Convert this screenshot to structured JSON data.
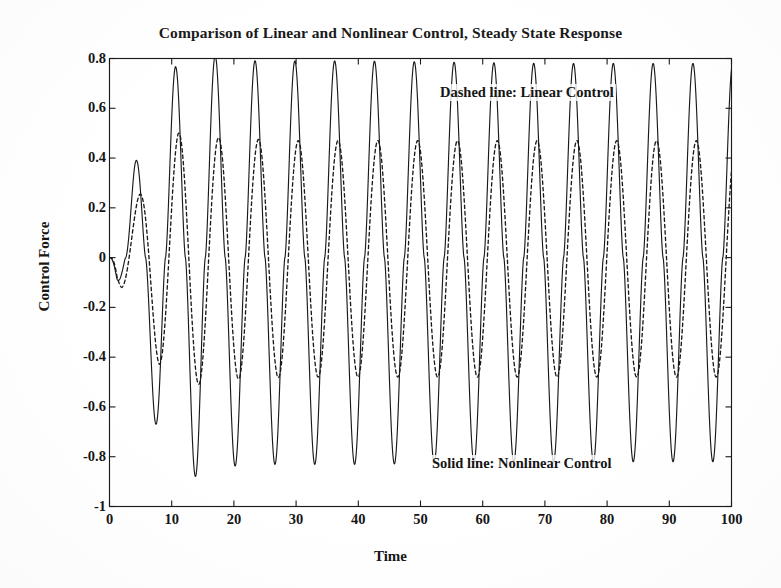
{
  "chart_data": {
    "type": "line",
    "title": "Comparison of Linear and Nonlinear Control, Steady State Response",
    "xlabel": "Time",
    "ylabel": "Control Force",
    "xlim": [
      0,
      100
    ],
    "ylim": [
      -1,
      0.8
    ],
    "xticks": [
      0,
      10,
      20,
      30,
      40,
      50,
      60,
      70,
      80,
      90,
      100
    ],
    "xtick_labels": [
      "0",
      "10",
      "20",
      "30",
      "40",
      "50",
      "60",
      "70",
      "80",
      "90",
      "100"
    ],
    "yticks": [
      -1,
      -0.8,
      -0.6,
      -0.4,
      -0.2,
      0,
      0.2,
      0.4,
      0.6,
      0.8
    ],
    "ytick_labels": [
      "-1",
      "-0.8",
      "-0.6",
      "-0.4",
      "-0.2",
      "0",
      "0.2",
      "0.4",
      "0.6",
      "0.8"
    ],
    "grid": false,
    "legend_position": "inside-annotations",
    "annotations": [
      {
        "id": "dashed",
        "text": "Dashed line: Linear Control",
        "x": 53,
        "y": 0.63
      },
      {
        "id": "solid",
        "text": "Solid line: Nonlinear Control",
        "x": 52,
        "y": -0.78
      }
    ],
    "line_color": "#1a1a1a",
    "background_color": "#ffffff",
    "period": 6.4,
    "series": [
      {
        "name": "Nonlinear Control",
        "style": "solid",
        "color": "#1a1a1a",
        "steady_state_peak": 0.78,
        "steady_state_trough": -0.82,
        "phase_offset": 0.0,
        "waveform": "peaked-sine",
        "peak_sharpness": 1.55,
        "envelope": [
          {
            "t": 0,
            "amp": 0.0
          },
          {
            "t": 2,
            "amp": 0.14
          },
          {
            "t": 4,
            "amp": 0.37
          },
          {
            "t": 8,
            "amp": 0.68
          },
          {
            "t": 11,
            "amp": 0.78
          },
          {
            "t": 14,
            "amp": 0.84
          },
          {
            "t": 18,
            "amp": 0.8
          },
          {
            "t": 24,
            "amp": 0.79
          },
          {
            "t": 40,
            "amp": 0.79
          },
          {
            "t": 70,
            "amp": 0.78
          },
          {
            "t": 100,
            "amp": 0.78
          }
        ],
        "peaks": [
          {
            "t": 4.2,
            "v": 0.37
          },
          {
            "t": 10.5,
            "v": 0.78
          },
          {
            "t": 16.8,
            "v": 0.8
          },
          {
            "t": 23.2,
            "v": 0.79
          },
          {
            "t": 29.5,
            "v": 0.79
          },
          {
            "t": 35.8,
            "v": 0.79
          },
          {
            "t": 42.2,
            "v": 0.79
          },
          {
            "t": 48.5,
            "v": 0.79
          },
          {
            "t": 54.8,
            "v": 0.78
          },
          {
            "t": 61.2,
            "v": 0.78
          },
          {
            "t": 67.5,
            "v": 0.78
          },
          {
            "t": 73.8,
            "v": 0.78
          },
          {
            "t": 80.2,
            "v": 0.78
          },
          {
            "t": 86.5,
            "v": 0.78
          },
          {
            "t": 92.8,
            "v": 0.78
          },
          {
            "t": 97.8,
            "v": 0.78
          }
        ],
        "troughs": [
          {
            "t": 1.8,
            "v": -0.13
          },
          {
            "t": 7.6,
            "v": -0.68
          },
          {
            "t": 13.8,
            "v": -0.84
          },
          {
            "t": 20.1,
            "v": -0.8
          },
          {
            "t": 26.4,
            "v": -0.82
          },
          {
            "t": 32.7,
            "v": -0.82
          },
          {
            "t": 39.0,
            "v": -0.82
          },
          {
            "t": 45.4,
            "v": -0.82
          },
          {
            "t": 51.7,
            "v": -0.82
          },
          {
            "t": 58.0,
            "v": -0.82
          },
          {
            "t": 64.3,
            "v": -0.82
          },
          {
            "t": 70.6,
            "v": -0.82
          },
          {
            "t": 77.0,
            "v": -0.82
          },
          {
            "t": 83.3,
            "v": -0.82
          },
          {
            "t": 89.6,
            "v": -0.82
          },
          {
            "t": 95.9,
            "v": -0.82
          }
        ]
      },
      {
        "name": "Linear Control",
        "style": "dashed",
        "color": "#1a1a1a",
        "steady_state_peak": 0.47,
        "steady_state_trough": -0.48,
        "phase_offset": 0.55,
        "waveform": "rounded-sine",
        "peak_sharpness": 1.0,
        "envelope": [
          {
            "t": 0,
            "amp": 0.0
          },
          {
            "t": 2,
            "amp": 0.13
          },
          {
            "t": 4,
            "amp": 0.21
          },
          {
            "t": 8,
            "amp": 0.42
          },
          {
            "t": 11,
            "amp": 0.5
          },
          {
            "t": 14,
            "amp": 0.5
          },
          {
            "t": 18,
            "amp": 0.48
          },
          {
            "t": 30,
            "amp": 0.47
          },
          {
            "t": 60,
            "amp": 0.47
          },
          {
            "t": 100,
            "amp": 0.47
          }
        ],
        "peaks": [
          {
            "t": 4.5,
            "v": 0.21
          },
          {
            "t": 11.0,
            "v": 0.5
          },
          {
            "t": 17.4,
            "v": 0.58
          },
          {
            "t": 23.7,
            "v": 0.52
          },
          {
            "t": 30.0,
            "v": 0.47
          },
          {
            "t": 36.4,
            "v": 0.47
          },
          {
            "t": 42.7,
            "v": 0.47
          },
          {
            "t": 49.0,
            "v": 0.47
          },
          {
            "t": 55.4,
            "v": 0.47
          },
          {
            "t": 61.7,
            "v": 0.47
          },
          {
            "t": 68.0,
            "v": 0.47
          },
          {
            "t": 74.4,
            "v": 0.47
          },
          {
            "t": 80.7,
            "v": 0.47
          },
          {
            "t": 87.0,
            "v": 0.47
          },
          {
            "t": 93.4,
            "v": 0.47
          }
        ],
        "troughs": [
          {
            "t": 2.0,
            "v": -0.13
          },
          {
            "t": 8.0,
            "v": -0.43
          },
          {
            "t": 14.3,
            "v": -0.5
          },
          {
            "t": 20.6,
            "v": -0.48
          },
          {
            "t": 27.0,
            "v": -0.48
          },
          {
            "t": 33.3,
            "v": -0.48
          },
          {
            "t": 39.6,
            "v": -0.48
          },
          {
            "t": 45.9,
            "v": -0.48
          },
          {
            "t": 52.3,
            "v": -0.48
          },
          {
            "t": 58.6,
            "v": -0.48
          },
          {
            "t": 64.9,
            "v": -0.48
          },
          {
            "t": 71.2,
            "v": -0.48
          },
          {
            "t": 77.6,
            "v": -0.48
          },
          {
            "t": 83.9,
            "v": -0.48
          },
          {
            "t": 90.2,
            "v": -0.48
          },
          {
            "t": 96.5,
            "v": -0.48
          }
        ]
      }
    ]
  }
}
